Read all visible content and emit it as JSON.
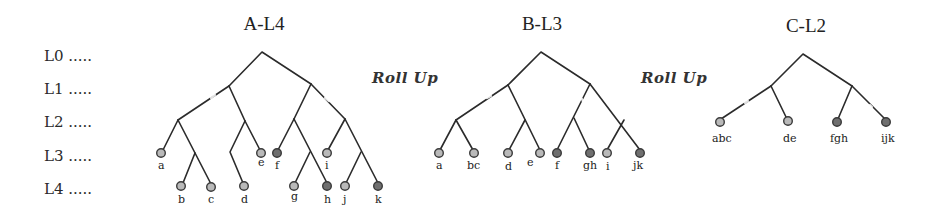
{
  "levels": [
    {
      "label": "L0 .....",
      "y": 48
    },
    {
      "label": "L1 .....",
      "y": 81
    },
    {
      "label": "L2 .....",
      "y": 114
    },
    {
      "label": "L3 .....",
      "y": 148
    },
    {
      "label": "L4 .....",
      "y": 181
    }
  ],
  "titles": {
    "a": "A-L4",
    "b": "B-L3",
    "c": "C-L2"
  },
  "rollup_labels": {
    "first": "Roll Up",
    "second": "Roll Up"
  },
  "colors": {
    "edge": "#2b2b2b",
    "node_light": "#b9b9b9",
    "node_dark": "#6f6f6f",
    "node_stroke": "#3a3a3a"
  },
  "trees": {
    "a": {
      "leaves": [
        {
          "label": "a",
          "tone": "light"
        },
        {
          "label": "b",
          "tone": "light"
        },
        {
          "label": "c",
          "tone": "light"
        },
        {
          "label": "d",
          "tone": "light"
        },
        {
          "label": "e",
          "tone": "light"
        },
        {
          "label": "f",
          "tone": "dark"
        },
        {
          "label": "g",
          "tone": "light"
        },
        {
          "label": "h",
          "tone": "dark"
        },
        {
          "label": "i",
          "tone": "light"
        },
        {
          "label": "j",
          "tone": "light"
        },
        {
          "label": "k",
          "tone": "dark"
        }
      ]
    },
    "b": {
      "leaves": [
        {
          "label": "a",
          "tone": "light"
        },
        {
          "label": "bc",
          "tone": "light"
        },
        {
          "label": "d",
          "tone": "light"
        },
        {
          "label": "e",
          "tone": "light"
        },
        {
          "label": "f",
          "tone": "dark"
        },
        {
          "label": "gh",
          "tone": "dark"
        },
        {
          "label": "i",
          "tone": "light"
        },
        {
          "label": "jk",
          "tone": "dark"
        }
      ]
    },
    "c": {
      "leaves": [
        {
          "label": "abc",
          "tone": "light"
        },
        {
          "label": "de",
          "tone": "light"
        },
        {
          "label": "fgh",
          "tone": "dark"
        },
        {
          "label": "ijk",
          "tone": "dark"
        }
      ]
    }
  }
}
